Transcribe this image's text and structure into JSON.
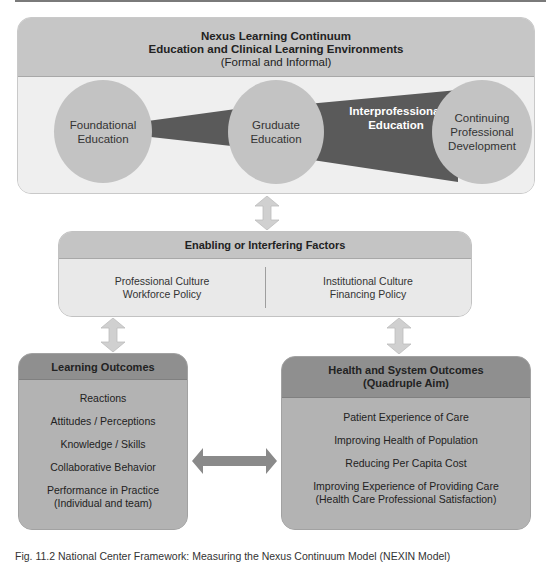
{
  "continuum": {
    "title_line1": "Nexus Learning Continuum",
    "title_line2": "Education and Clinical Learning Environments",
    "subtitle": "(Formal and Informal)",
    "stages": [
      {
        "line1": "Foundational",
        "line2": "Education"
      },
      {
        "line1": "Gruduate",
        "line2": "Education"
      },
      {
        "line1": "Continuing",
        "line2": "Professional",
        "line3": "Development"
      }
    ],
    "band_label_line1": "Interprofessional",
    "band_label_line2": "Education"
  },
  "factors": {
    "title": "Enabling or Interfering Factors",
    "left": {
      "line1": "Professional Culture",
      "line2": "Workforce Policy"
    },
    "right": {
      "line1": "Institutional Culture",
      "line2": "Financing Policy"
    }
  },
  "learning_outcomes": {
    "title": "Learning Outcomes",
    "items": [
      "Reactions",
      "Attitudes / Perceptions",
      "Knowledge / Skills",
      "Collaborative Behavior"
    ],
    "last_item_line1": "Performance in Practice",
    "last_item_line2": "(Individual and team)"
  },
  "health_outcomes": {
    "title_line1": "Health and System Outcomes",
    "title_line2": "(Quadruple Aim)",
    "items": [
      "Patient Experience of Care",
      "Improving Health of Population",
      "Reducing Per Capita Cost"
    ],
    "last_item_line1": "Improving Experience of Providing Care",
    "last_item_line2": "(Health Care Professional Satisfaction)"
  },
  "caption": "Fig. 11.2 National Center Framework: Measuring the Nexus Continuum Model (NEXIN Model)",
  "colors": {
    "band": "#5a5a5a",
    "circle": "#c3c3c3",
    "arrow_light": "#d0d0d0",
    "arrow_dark": "#8a8a8a"
  }
}
